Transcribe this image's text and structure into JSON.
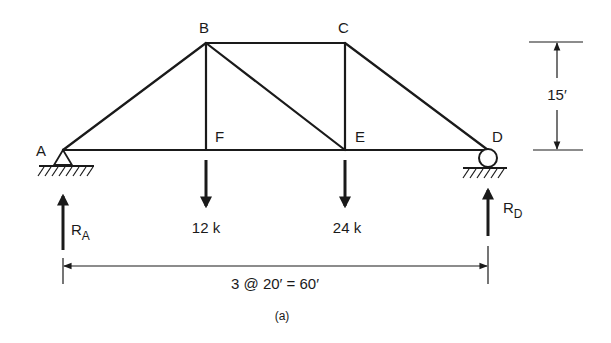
{
  "figure": {
    "caption": "(a)",
    "type": "truss",
    "colors": {
      "ink": "#1a1a1a",
      "background": "#ffffff"
    }
  },
  "joints": {
    "A": {
      "label": "A",
      "support": "pin"
    },
    "B": {
      "label": "B"
    },
    "C": {
      "label": "C"
    },
    "D": {
      "label": "D",
      "support": "roller"
    },
    "E": {
      "label": "E"
    },
    "F": {
      "label": "F"
    }
  },
  "members": [
    "AB",
    "BC",
    "CD",
    "AF",
    "FE",
    "ED",
    "BF",
    "BE",
    "CE"
  ],
  "loads": [
    {
      "joint": "F",
      "label": "12 k",
      "direction": "down"
    },
    {
      "joint": "E",
      "label": "24 k",
      "direction": "down"
    }
  ],
  "reactions": [
    {
      "joint": "A",
      "label": "R",
      "subscript": "A",
      "direction": "up"
    },
    {
      "joint": "D",
      "label": "R",
      "subscript": "D",
      "direction": "up"
    }
  ],
  "dimensions": {
    "height": {
      "label": "15′"
    },
    "span": {
      "label": "3 @ 20′ = 60′"
    }
  }
}
